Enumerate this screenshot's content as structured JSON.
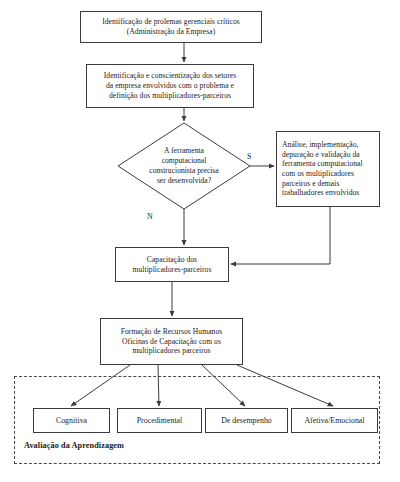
{
  "diagram": {
    "type": "flowchart",
    "nodes": {
      "problem_identification": {
        "label": "Identificação de prolemas gerenciais críticos\n(Administração da Empresa)",
        "shape": "rectangle"
      },
      "awareness": {
        "label": "Identificação e conscientização dos setores\nda empresa envolvidos com o problema e\ndefinição dos multiplicadores-parceiros",
        "shape": "rectangle"
      },
      "decision": {
        "label": "A ferramenta\ncomputacional\nconstrucionista precisa\nser desenvolvida?",
        "shape": "diamond"
      },
      "tool_development": {
        "label": "Análise, implementação,\ndepuração e validação da\nferramenta computacional\ncom os multiplicadores\nparceiros e demais\ntrabalhadores envolvidos",
        "shape": "rectangle"
      },
      "training": {
        "label": "Capacitação dos\nmultiplicadores-parceiros",
        "shape": "rectangle"
      },
      "human_resources": {
        "label": "Formação de Recursos Humanos\nOficinas de Capacitação com os\nmultiplicadores parceiros",
        "shape": "rectangle"
      },
      "cognitive": {
        "label": "Cognitiva",
        "shape": "rectangle"
      },
      "procedural": {
        "label": "Procedimental",
        "shape": "rectangle"
      },
      "performance": {
        "label": "De desempenho",
        "shape": "rectangle"
      },
      "affective": {
        "label": "Afetiva/Emocional",
        "shape": "rectangle"
      }
    },
    "edge_labels": {
      "yes": "S",
      "no": "N"
    },
    "group": {
      "caption": "Avaliação da Aprendizagem",
      "border": "dashed"
    },
    "colors": {
      "stroke": "#3b3b3b",
      "text": "#1a1a1a",
      "background": "#ffffff",
      "dashed_border": "#4a4a4a"
    }
  }
}
